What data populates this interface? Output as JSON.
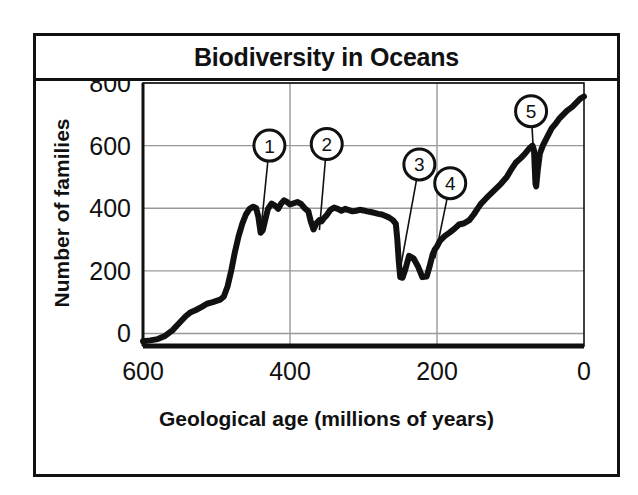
{
  "figure": {
    "title": "Biodiversity in Oceans",
    "frame_color": "#111111",
    "background": "#ffffff"
  },
  "axes": {
    "ylabel": "Number of families",
    "xlabel": "Geological age (millions of years)",
    "yticks": [
      "0",
      "200",
      "400",
      "600",
      "800"
    ],
    "xticks": [
      "600",
      "400",
      "200",
      "0"
    ],
    "grid_color": "#999999",
    "curve_color": "#111111"
  },
  "callouts": [
    {
      "id": "1",
      "label": "1",
      "x_ma": 440,
      "y_val": 320,
      "cx_ma": 428,
      "cy_val": 600
    },
    {
      "id": "2",
      "label": "2",
      "x_ma": 360,
      "y_val": 330,
      "cx_ma": 350,
      "cy_val": 605
    },
    {
      "id": "3",
      "label": "3",
      "x_ma": 252,
      "y_val": 180,
      "cx_ma": 224,
      "cy_val": 540
    },
    {
      "id": "4",
      "label": "4",
      "x_ma": 203,
      "y_val": 240,
      "cx_ma": 182,
      "cy_val": 480
    },
    {
      "id": "5",
      "label": "5",
      "x_ma": 66,
      "y_val": 470,
      "cx_ma": 72,
      "cy_val": 710
    }
  ],
  "chart_data": {
    "type": "line",
    "title": "Biodiversity in Oceans",
    "xlabel": "Geological age (millions of years)",
    "ylabel": "Number of families",
    "xlim": [
      600,
      0
    ],
    "ylim": [
      -40,
      800
    ],
    "x_reversed": true,
    "grid": true,
    "legend": null,
    "series": [
      {
        "name": "Number of marine families",
        "x": [
          600,
          590,
          580,
          570,
          560,
          550,
          542,
          535,
          528,
          520,
          513,
          505,
          500,
          495,
          490,
          485,
          480,
          475,
          470,
          465,
          460,
          455,
          450,
          446,
          443,
          440,
          437,
          434,
          430,
          425,
          420,
          416,
          412,
          408,
          404,
          400,
          395,
          390,
          385,
          380,
          375,
          372,
          368,
          364,
          360,
          357,
          354,
          350,
          345,
          340,
          335,
          330,
          325,
          320,
          315,
          310,
          305,
          300,
          295,
          290,
          285,
          280,
          275,
          270,
          265,
          260,
          256,
          254,
          252,
          250,
          247,
          243,
          238,
          232,
          226,
          220,
          214,
          210,
          206,
          203,
          200,
          196,
          190,
          183,
          176,
          170,
          163,
          156,
          150,
          145,
          140,
          133,
          126,
          120,
          113,
          105,
          100,
          93,
          86,
          80,
          74,
          70,
          68,
          67,
          66,
          65,
          63,
          60,
          56,
          50,
          44,
          38,
          33,
          28,
          23,
          16,
          10,
          5,
          0
        ],
        "y": [
          -25,
          -22,
          -18,
          -8,
          10,
          35,
          55,
          68,
          75,
          85,
          95,
          100,
          104,
          108,
          118,
          150,
          200,
          260,
          310,
          350,
          380,
          398,
          405,
          400,
          372,
          322,
          330,
          360,
          398,
          415,
          408,
          398,
          415,
          425,
          420,
          412,
          416,
          420,
          414,
          400,
          390,
          360,
          332,
          352,
          362,
          358,
          368,
          378,
          395,
          402,
          398,
          392,
          398,
          394,
          390,
          392,
          395,
          393,
          390,
          388,
          385,
          382,
          380,
          375,
          370,
          362,
          350,
          300,
          230,
          180,
          178,
          205,
          248,
          240,
          215,
          180,
          182,
          215,
          252,
          268,
          278,
          296,
          310,
          322,
          335,
          348,
          352,
          362,
          380,
          398,
          415,
          432,
          448,
          462,
          478,
          500,
          520,
          545,
          560,
          575,
          592,
          600,
          585,
          530,
          478,
          470,
          520,
          575,
          600,
          628,
          655,
          672,
          688,
          700,
          712,
          724,
          738,
          750,
          757
        ]
      }
    ]
  }
}
